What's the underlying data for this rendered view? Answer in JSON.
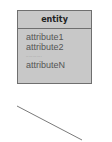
{
  "entity": {
    "title": "entity",
    "attributes": [
      "attribute1",
      "attribute2"
    ],
    "ellipsis": "............",
    "last_attribute": "attributeN"
  },
  "colors": {
    "fill": "#c8c8c8",
    "border": "#6f6f6f",
    "line": "#7a7a7a"
  },
  "relationship_line": {
    "x1": 17,
    "y1": 106,
    "x2": 82,
    "y2": 140
  }
}
